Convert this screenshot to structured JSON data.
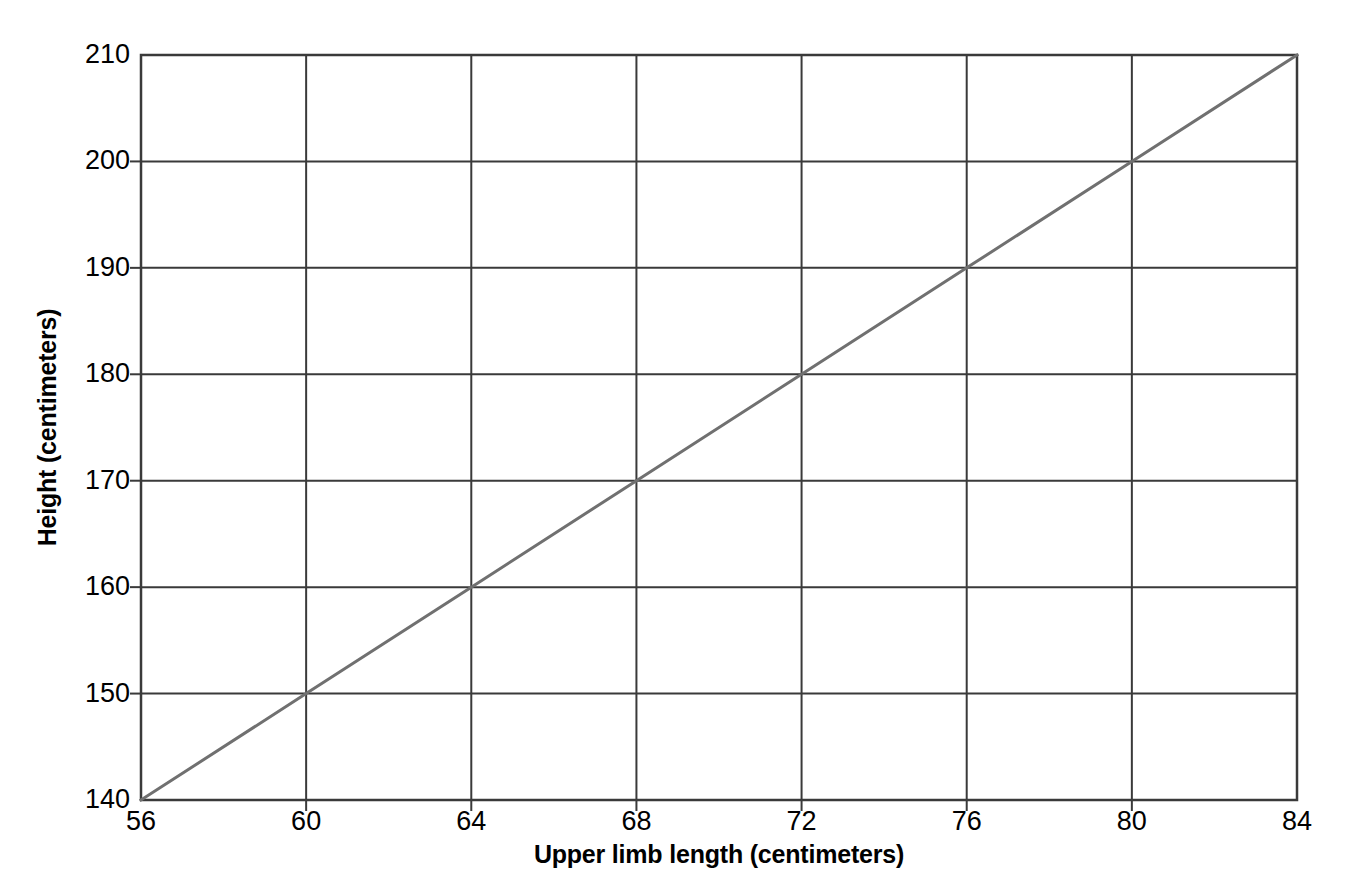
{
  "chart_data": {
    "type": "line",
    "title": "",
    "xlabel": "Upper limb length (centimeters)",
    "ylabel": "Height (centimeters)",
    "xlim": [
      56,
      84
    ],
    "ylim": [
      140,
      210
    ],
    "xticks": [
      56,
      60,
      64,
      68,
      72,
      76,
      80,
      84
    ],
    "yticks": [
      140,
      150,
      160,
      170,
      180,
      190,
      200,
      210
    ],
    "xtick_labels": [
      "56",
      "60",
      "64",
      "68",
      "72",
      "76",
      "80",
      "84"
    ],
    "ytick_labels": [
      "140",
      "150",
      "160",
      "170",
      "180",
      "190",
      "200",
      "210"
    ],
    "grid": true,
    "legend": "none",
    "series": [
      {
        "name": "Height vs upper limb length",
        "color": "#707070",
        "x": [
          56,
          60,
          64,
          68,
          72,
          76,
          80,
          84
        ],
        "values": [
          140,
          150,
          160,
          170,
          180,
          190,
          200,
          210
        ]
      }
    ]
  },
  "style": {
    "background": "#ffffff",
    "grid_color": "#3a3a3a",
    "axis_color": "#3a3a3a",
    "line_color": "#707070",
    "text_color": "#000000"
  }
}
